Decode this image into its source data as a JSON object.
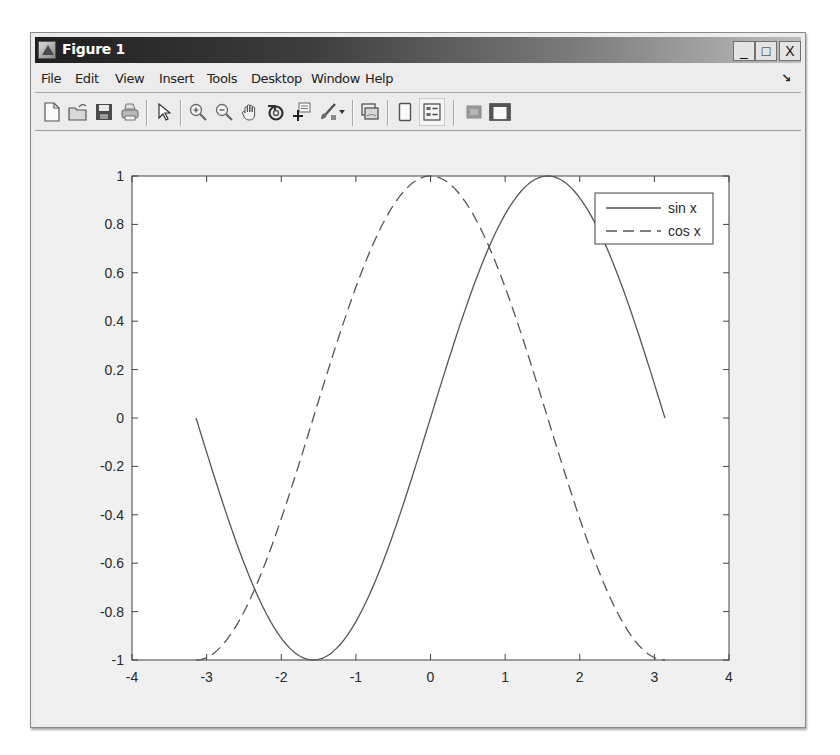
{
  "window": {
    "title": "Figure 1",
    "buttons": {
      "minimize": "_",
      "maximize": "□",
      "close": "X"
    }
  },
  "menubar": {
    "items": [
      "File",
      "Edit",
      "View",
      "Insert",
      "Tools",
      "Desktop",
      "Window",
      "Help"
    ],
    "dock_arrow": "↘"
  },
  "toolbar": {
    "buttons": [
      {
        "name": "new-figure",
        "icon": "new-file-icon"
      },
      {
        "name": "open-file",
        "icon": "open-folder-icon"
      },
      {
        "name": "save-figure",
        "icon": "save-icon"
      },
      {
        "name": "print-figure",
        "icon": "print-icon"
      },
      {
        "name": "edit-plot",
        "icon": "pointer-arrow-icon"
      },
      {
        "name": "zoom-in",
        "icon": "zoom-in-icon"
      },
      {
        "name": "zoom-out",
        "icon": "zoom-out-icon"
      },
      {
        "name": "pan",
        "icon": "pan-hand-icon"
      },
      {
        "name": "rotate-3d",
        "icon": "rotate-3d-icon"
      },
      {
        "name": "data-cursor",
        "icon": "data-cursor-icon"
      },
      {
        "name": "brush",
        "icon": "brush-icon"
      },
      {
        "name": "brush-dropdown",
        "icon": "dropdown-arrow-icon"
      },
      {
        "name": "link-plot",
        "icon": "link-plot-icon"
      },
      {
        "name": "insert-colorbar",
        "icon": "colorbar-icon"
      },
      {
        "name": "insert-legend",
        "icon": "legend-icon",
        "active": true
      },
      {
        "name": "hide-plot-tools",
        "icon": "hide-plot-tools-icon"
      },
      {
        "name": "show-plot-tools",
        "icon": "show-plot-tools-icon"
      }
    ]
  },
  "chart_data": {
    "type": "line",
    "title": "",
    "xlabel": "",
    "ylabel": "",
    "xlim": [
      -4,
      4
    ],
    "ylim": [
      -1,
      1
    ],
    "grid": false,
    "legend_position": "northeast",
    "x_ticks": [
      -4,
      -3,
      -2,
      -1,
      0,
      1,
      2,
      3,
      4
    ],
    "x_tick_labels": [
      "-4",
      "-3",
      "-2",
      "-1",
      "0",
      "1",
      "2",
      "3",
      "4"
    ],
    "y_ticks": [
      1,
      0.8,
      0.6,
      0.4,
      0.2,
      0,
      -0.2,
      -0.4,
      -0.6,
      -0.8,
      -1
    ],
    "y_tick_labels": [
      "1",
      "0.8",
      "0.6",
      "0.4",
      "0.2",
      "0",
      "-0.2",
      "-0.4",
      "-0.6",
      "-0.8",
      "-1"
    ],
    "x_domain": [
      -3.1416,
      3.1416
    ],
    "series": [
      {
        "name": "sin x",
        "function": "sin",
        "line_style": "solid",
        "color": "#555555",
        "x": [
          -3.1416,
          -2.3562,
          -1.5708,
          -0.7854,
          0,
          0.7854,
          1.5708,
          2.3562,
          3.1416
        ],
        "values": [
          0,
          -0.7071,
          -1,
          -0.7071,
          0,
          0.7071,
          1,
          0.7071,
          0
        ]
      },
      {
        "name": "cos x",
        "function": "cos",
        "line_style": "dashed",
        "color": "#555555",
        "x": [
          -3.1416,
          -2.3562,
          -1.5708,
          -0.7854,
          0,
          0.7854,
          1.5708,
          2.3562,
          3.1416
        ],
        "values": [
          -1,
          -0.7071,
          0,
          0.7071,
          1,
          0.7071,
          0,
          -0.7071,
          -1
        ]
      }
    ]
  },
  "legend": {
    "entries": [
      {
        "label": "sin x",
        "style": "solid"
      },
      {
        "label": "cos x",
        "style": "dashed"
      }
    ]
  }
}
